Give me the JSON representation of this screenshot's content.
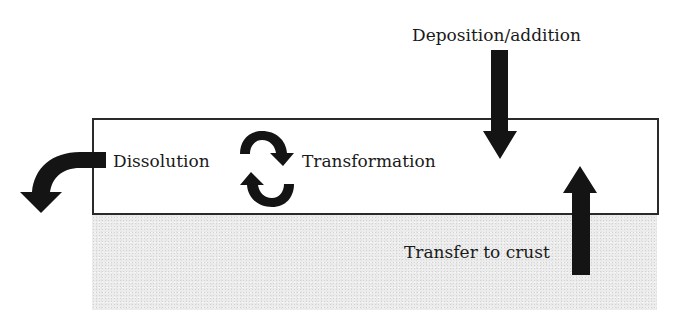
{
  "diagram": {
    "layer_label": "",
    "processes": {
      "dissolution": "Dissolution",
      "transformation": "Transformation",
      "deposition": "Deposition/addition",
      "transfer": "Transfer to crust"
    },
    "colors": {
      "arrow": "#141414",
      "box_border": "#2a2a2a",
      "crust_fill": "#ececec"
    }
  }
}
